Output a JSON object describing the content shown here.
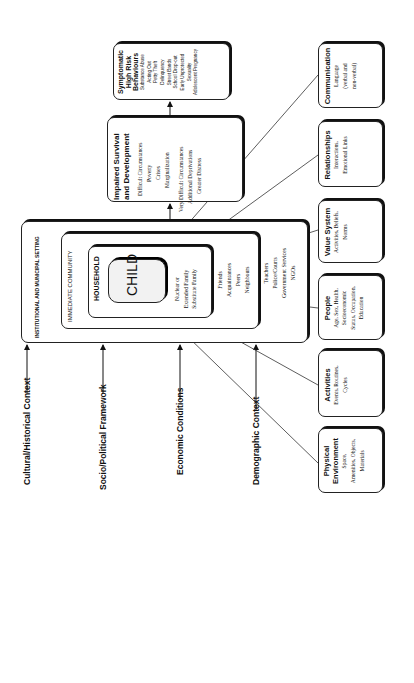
{
  "diagram": {
    "nested_settings": {
      "institutional": "INSTITUTIONAL AND MUNICIPAL SETTING",
      "immediate_community": "IMMEDIATE COMMUNITY",
      "household": "HOUSEHOLD",
      "child": "CHILD",
      "household_members": [
        "Nuclear or",
        "Extended Family",
        "Substitute Family"
      ],
      "community_members": [
        "Friends",
        "Acquaintances",
        "Peers",
        "Neighbours"
      ],
      "institutional_members": [
        "Teachers",
        "Police/Courts",
        "Government Services",
        "NGOs"
      ]
    },
    "outcomes": {
      "impaired": {
        "title_lines": [
          "Impaired Survival",
          "and Development"
        ],
        "items_a": [
          "Difficult Circumstances",
          "Poverty",
          "Crises",
          "Marginalization"
        ],
        "items_b": [
          "Very Difficult Circumstances",
          "Additional Deprivations",
          "Greater Distress"
        ]
      },
      "symptomatic": {
        "title_lines": [
          "Symptomatic",
          "High Risk",
          "Behaviours"
        ],
        "items": [
          "Substance Abuse",
          "Acting Out",
          "Petty Theft",
          "Delinquency",
          "Street Bands",
          "School Drop-out",
          "Early Unprotected",
          "Sexuality",
          "Adolescent Pregnancy"
        ]
      }
    },
    "influences": [
      {
        "title": "Communication",
        "lines": [
          "Language",
          "(verbal and",
          "non-verbal)"
        ]
      },
      {
        "title": "Relationships",
        "lines": [
          "Interactions,",
          "Emotional Links"
        ]
      },
      {
        "title": "Value System",
        "lines": [
          "Activities, Beliefs,",
          "Norms"
        ]
      },
      {
        "title": "People",
        "lines": [
          "Age, Sex, Health,",
          "Socioeconomic",
          "Status, Occupation,",
          "Education"
        ]
      },
      {
        "title": "Activities",
        "lines": [
          "Events, Routines,",
          "Cycles"
        ]
      },
      {
        "title_lines": [
          "Physical",
          "Environment"
        ],
        "lines": [
          "Space,",
          "Amenities, Objects,",
          "Materials"
        ]
      }
    ],
    "contexts": [
      "Cultural/Historical Context",
      "Socio/Political Framework",
      "Economic Conditions",
      "Demographic Context"
    ]
  }
}
